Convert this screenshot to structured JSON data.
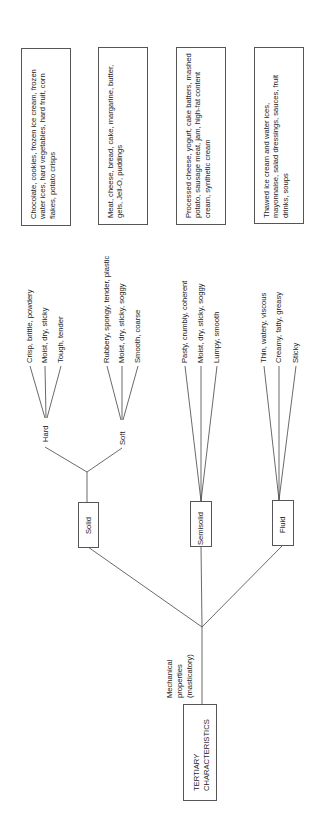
{
  "root": {
    "label": "TERTIARY CHARACTERISTICS",
    "line1": "TERTIARY",
    "line2": "CHARACTERISTICS",
    "edge_label_lines": [
      "Mechanical",
      "properties",
      "(masticatory)"
    ]
  },
  "states": [
    {
      "label": "Solid",
      "subgroups": [
        {
          "label": "Hard",
          "attributes": [
            "Crisp, brittle, powdery",
            "Moist, dry, sticky",
            "Tough, tender"
          ]
        },
        {
          "label": "Soft",
          "attributes": [
            "Rubbery, spongy, tender, plastic",
            "Moist, dry, sticky, soggy",
            "Smooth, coarse"
          ]
        }
      ]
    },
    {
      "label": "Semisolid",
      "attributes": [
        "Pasty, crumbly, coherent",
        "Moist, dry, sticky, soggy",
        "Lumpy, smooth"
      ]
    },
    {
      "label": "Fluid",
      "attributes": [
        "Thin, watery, viscous",
        "Creamy, fatty, greasy",
        "Sticky"
      ]
    }
  ],
  "examples": [
    "Chocolate, cookies, frozen ice cream, frozen water ices, hard vegetables, hard fruit, corn flakes, potato crisps",
    "Meat, cheese, bread, cake, margarine, butter, gels, Jell-O, puddings",
    "Processed cheese, yogurt, cake batters, mashed potato, sausage meat, jam, high-fat content cream, synthetic cream",
    "Thawed ice cream and water ices, mayonnaise, salad dressings, sauces, fruit drinks, soups"
  ]
}
